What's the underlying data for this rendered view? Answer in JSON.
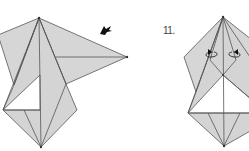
{
  "diagram": {
    "type": "origami-instructions",
    "steps": [
      {
        "label": "",
        "description": "folded model with arrow indicating fold direction",
        "arrow": "push-arrow"
      },
      {
        "label": "11.",
        "description": "symmetrical folded model with two curved fold arrows"
      }
    ]
  },
  "colors": {
    "paper": "#d4d4d4",
    "line": "#4a4a4a",
    "white": "#ffffff"
  }
}
